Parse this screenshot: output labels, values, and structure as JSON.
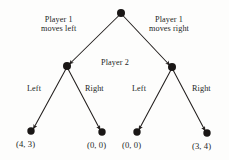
{
  "diagram": {
    "type": "game-tree",
    "ink_color": "#231f1e",
    "background_color": "#fdfdfc",
    "nodes": [
      {
        "id": "root",
        "label": "",
        "x": 121,
        "y": 13,
        "player": "1"
      },
      {
        "id": "n1",
        "label": "",
        "x": 67,
        "y": 66,
        "player": "2"
      },
      {
        "id": "n2",
        "label": "",
        "x": 172,
        "y": 67,
        "player": "2"
      },
      {
        "id": "leaf1",
        "label": "(4, 3)",
        "x": 31,
        "y": 131
      },
      {
        "id": "leaf2",
        "label": "(0, 0)",
        "x": 102,
        "y": 132
      },
      {
        "id": "leaf3",
        "label": "(0, 0)",
        "x": 137,
        "y": 132
      },
      {
        "id": "leaf4",
        "label": "(3, 4)",
        "x": 207,
        "y": 133
      }
    ],
    "edges": [
      {
        "from": "root",
        "to": "n1",
        "action": "moves left"
      },
      {
        "from": "root",
        "to": "n2",
        "action": "moves right"
      },
      {
        "from": "n1",
        "to": "leaf1",
        "action": "Left"
      },
      {
        "from": "n1",
        "to": "leaf2",
        "action": "Right"
      },
      {
        "from": "n2",
        "to": "leaf3",
        "action": "Left"
      },
      {
        "from": "n2",
        "to": "leaf4",
        "action": "Right"
      }
    ],
    "labels": {
      "player1_left_line1": "Player 1",
      "player1_left_line2": "moves left",
      "player1_right_line1": "Player 1",
      "player1_right_line2": "moves right",
      "player2": "Player 2",
      "left_1": "Left",
      "right_1": "Right",
      "left_2": "Left",
      "right_2": "Right"
    },
    "payoffs": {
      "leaf1": "(4, 3)",
      "leaf2": "(0, 0)",
      "leaf3": "(0, 0)",
      "leaf4": "(3, 4)"
    }
  }
}
